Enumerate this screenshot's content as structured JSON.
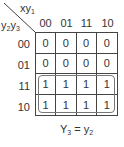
{
  "kmap": {
    "corner_top_label": {
      "main": "xy",
      "sub": "1"
    },
    "corner_left_label": {
      "a": "y",
      "a_sub": "2",
      "b": "y",
      "b_sub": "3"
    },
    "column_headers": [
      "00",
      "01",
      "11",
      "10"
    ],
    "row_headers": [
      "00",
      "01",
      "11",
      "10"
    ],
    "cells": [
      [
        "0",
        "0",
        "0",
        "0"
      ],
      [
        "0",
        "0",
        "0",
        "0"
      ],
      [
        "1",
        "1",
        "1",
        "1"
      ],
      [
        "1",
        "1",
        "1",
        "1"
      ]
    ],
    "grouping": {
      "rows": [
        "11",
        "10"
      ],
      "columns": "all"
    },
    "equation": {
      "lhs": "Y",
      "lhs_sub": "3",
      "op": " = ",
      "rhs": "y",
      "rhs_sub": "2"
    }
  }
}
